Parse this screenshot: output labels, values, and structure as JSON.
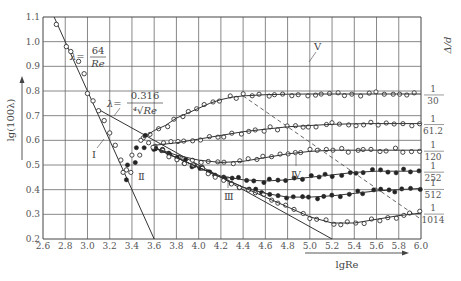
{
  "chart_data": {
    "type": "scatter",
    "xlabel": "lgRe",
    "ylabel": "lg(100λ)",
    "right_label": "Δ/d",
    "xlim": [
      2.6,
      6.0
    ],
    "ylim": [
      0.2,
      1.1
    ],
    "grid": true,
    "x_ticks": [
      "2.6",
      "2.8",
      "3.0",
      "3.2",
      "3.4",
      "3.6",
      "3.8",
      "4.0",
      "4.2",
      "4.4",
      "4.6",
      "4.8",
      "5.0",
      "5.2",
      "5.4",
      "5.6",
      "5.8",
      "6.0"
    ],
    "y_ticks": [
      "0.2",
      "0.3",
      "0.4",
      "0.5",
      "0.6",
      "0.7",
      "0.8",
      "0.9",
      "1.0",
      "1.1"
    ],
    "annotations": {
      "laminar_formula": {
        "lhs": "λ=",
        "num": "64",
        "den": "Re"
      },
      "blasius_formula": {
        "lhs": "λ=",
        "num": "0.316",
        "den": "⁴√Re"
      },
      "regions": [
        "Ⅰ",
        "Ⅱ",
        "Ⅲ",
        "Ⅳ",
        "Ⅴ"
      ]
    },
    "lines": {
      "laminar": {
        "name": "λ=64/Re",
        "x": [
          2.7,
          3.6
        ],
        "y": [
          1.1,
          0.2
        ]
      },
      "blasius": {
        "name": "λ=0.316/Re^0.25",
        "x": [
          3.1,
          5.2
        ],
        "y": [
          0.725,
          0.2
        ]
      },
      "boundary_dashed": {
        "x": [
          4.4,
          6.0
        ],
        "y": [
          0.78,
          0.28
        ]
      }
    },
    "series": [
      {
        "name": "1/30",
        "label_num": "1",
        "label_den": "30",
        "marker": "open",
        "x": [
          3.5,
          3.6,
          3.7,
          3.8,
          3.9,
          4.0,
          4.1,
          4.2,
          4.3,
          4.4,
          4.6,
          4.8,
          5.0,
          5.2,
          5.4,
          5.6,
          5.8,
          6.0
        ],
        "y": [
          0.61,
          0.64,
          0.66,
          0.69,
          0.71,
          0.73,
          0.75,
          0.765,
          0.775,
          0.78,
          0.785,
          0.787,
          0.788,
          0.788,
          0.788,
          0.788,
          0.788,
          0.788
        ]
      },
      {
        "name": "1/61.2",
        "label_num": "1",
        "label_den": "61.2",
        "marker": "open",
        "x": [
          3.6,
          3.8,
          4.0,
          4.2,
          4.4,
          4.6,
          4.8,
          5.0,
          5.2,
          5.4,
          5.6,
          5.8,
          6.0
        ],
        "y": [
          0.58,
          0.59,
          0.605,
          0.62,
          0.635,
          0.645,
          0.655,
          0.66,
          0.665,
          0.667,
          0.668,
          0.668,
          0.668
        ]
      },
      {
        "name": "1/120",
        "label_num": "1",
        "label_den": "120",
        "marker": "open",
        "x": [
          3.6,
          3.8,
          4.0,
          4.2,
          4.4,
          4.6,
          4.8,
          5.0,
          5.2,
          5.4,
          5.6,
          5.8,
          6.0
        ],
        "y": [
          0.57,
          0.54,
          0.52,
          0.51,
          0.515,
          0.53,
          0.545,
          0.555,
          0.56,
          0.56,
          0.56,
          0.56,
          0.56
        ]
      },
      {
        "name": "1/252",
        "label_num": "1",
        "label_den": "252",
        "marker": "filled",
        "x": [
          3.6,
          3.8,
          4.0,
          4.2,
          4.4,
          4.6,
          4.8,
          5.0,
          5.2,
          5.4,
          5.6,
          5.8,
          6.0
        ],
        "y": [
          0.57,
          0.53,
          0.49,
          0.455,
          0.44,
          0.435,
          0.44,
          0.45,
          0.46,
          0.47,
          0.475,
          0.475,
          0.475
        ]
      },
      {
        "name": "1/512",
        "label_num": "1",
        "label_den": "512",
        "marker": "filled",
        "x": [
          3.6,
          3.8,
          4.0,
          4.2,
          4.4,
          4.6,
          4.8,
          5.0,
          5.2,
          5.4,
          5.6,
          5.8,
          6.0
        ],
        "y": [
          0.57,
          0.53,
          0.49,
          0.45,
          0.41,
          0.385,
          0.37,
          0.37,
          0.375,
          0.385,
          0.395,
          0.4,
          0.405
        ]
      },
      {
        "name": "1/1014",
        "label_num": "1",
        "label_den": "1014",
        "marker": "open",
        "x": [
          3.6,
          3.8,
          4.0,
          4.2,
          4.4,
          4.6,
          4.8,
          5.0,
          5.2,
          5.4,
          5.6,
          5.8,
          6.0
        ],
        "y": [
          0.57,
          0.53,
          0.49,
          0.45,
          0.41,
          0.37,
          0.33,
          0.29,
          0.265,
          0.265,
          0.28,
          0.295,
          0.305
        ]
      }
    ],
    "laminar_points": {
      "marker": "open",
      "x": [
        2.72,
        2.81,
        2.85,
        2.92,
        2.97,
        3.0,
        3.05,
        3.1,
        3.15,
        3.2,
        3.25,
        3.3,
        3.35
      ],
      "y": [
        1.07,
        0.98,
        0.96,
        0.92,
        0.87,
        0.79,
        0.76,
        0.72,
        0.68,
        0.63,
        0.58,
        0.52,
        0.48
      ]
    },
    "transition_points": {
      "marker": "mixed",
      "x": [
        3.32,
        3.36,
        3.4,
        3.44,
        3.48,
        3.52
      ],
      "y": [
        0.47,
        0.5,
        0.54,
        0.57,
        0.6,
        0.62
      ]
    }
  }
}
